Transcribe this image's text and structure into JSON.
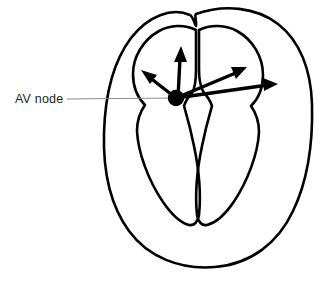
{
  "figure": {
    "type": "anatomical-line-diagram",
    "background_color": "#ffffff",
    "outline_color": "#000000",
    "node_color": "#000000",
    "arrow_color": "#000000",
    "leader_line_color": "#8c8c8c",
    "label_text_color": "#231f20"
  },
  "annotations": {
    "av_node": {
      "label": "AV node",
      "label_x": 15,
      "label_y": 103,
      "leader_from_x": 67,
      "leader_from_y": 99,
      "leader_to_x": 176,
      "leader_to_y": 98
    }
  },
  "node": {
    "name": "AV node",
    "center_x": 176,
    "center_y": 98,
    "radius": 8
  },
  "arrows": [
    {
      "name": "arrow-upper-left",
      "from_x": 176,
      "from_y": 98,
      "to_x": 143,
      "to_y": 72
    },
    {
      "name": "arrow-up",
      "from_x": 178,
      "from_y": 98,
      "to_x": 181,
      "to_y": 48
    },
    {
      "name": "arrow-upper-right",
      "from_x": 176,
      "from_y": 98,
      "to_x": 246,
      "to_y": 68
    },
    {
      "name": "arrow-right",
      "from_x": 176,
      "from_y": 98,
      "to_x": 277,
      "to_y": 84
    }
  ],
  "structures": [
    {
      "name": "outer-wall",
      "label": "Heart outer wall"
    },
    {
      "name": "left-atrium",
      "label": "Atrium (left side of image)"
    },
    {
      "name": "right-atrium",
      "label": "Atrium (right side of image)"
    },
    {
      "name": "left-ventricle",
      "label": "Ventricle (left side of image)"
    },
    {
      "name": "right-ventricle",
      "label": "Ventricle (right side of image)"
    }
  ]
}
